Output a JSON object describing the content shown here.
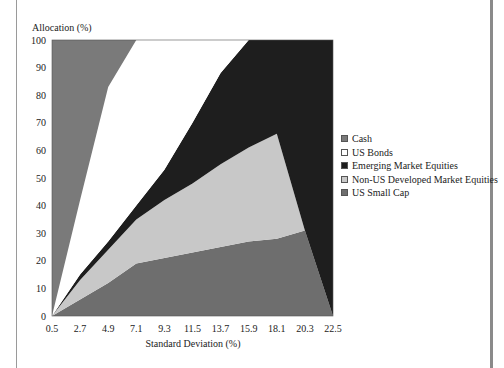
{
  "chart_data": {
    "type": "area",
    "stacked": true,
    "title": "",
    "xlabel": "Standard Deviation (%)",
    "ylabel": "Allocation (%)",
    "x": [
      0.5,
      2.7,
      4.9,
      7.1,
      9.3,
      11.5,
      13.7,
      15.9,
      18.1,
      20.3,
      22.5
    ],
    "xticks": [
      "0.5",
      "2.7",
      "4.9",
      "7.1",
      "9.3",
      "11.5",
      "13.7",
      "15.9",
      "18.1",
      "20.3",
      "22.5"
    ],
    "yticks": [
      "0",
      "10",
      "20",
      "30",
      "40",
      "50",
      "60",
      "70",
      "80",
      "90",
      "100"
    ],
    "ylim": [
      0,
      100
    ],
    "xlim": [
      0.5,
      22.5
    ],
    "grid": false,
    "legend_position": "right",
    "series": [
      {
        "name": "US Small Cap",
        "color": "#6e6e6e",
        "values": [
          0,
          6,
          12,
          19,
          21,
          23,
          25,
          27,
          28,
          31,
          0
        ]
      },
      {
        "name": "Non-US Developed Market Equities",
        "color": "#c8c8c8",
        "values": [
          0,
          7,
          12,
          16,
          21,
          25,
          30,
          34,
          38,
          0,
          0
        ]
      },
      {
        "name": "Emerging Market Equities",
        "color": "#1e1e1e",
        "values": [
          0,
          2,
          3,
          5,
          11,
          22,
          33,
          39,
          34,
          69,
          100
        ]
      },
      {
        "name": "US Bonds",
        "color": "#ffffff",
        "values": [
          0,
          27,
          56,
          60,
          47,
          30,
          12,
          0,
          0,
          0,
          0
        ]
      },
      {
        "name": "Cash",
        "color": "#7a7a7a",
        "values": [
          100,
          58,
          17,
          0,
          0,
          0,
          0,
          0,
          0,
          0,
          0
        ]
      }
    ],
    "legend": [
      "Cash",
      "US Bonds",
      "Emerging Market Equities",
      "Non-US Developed Market Equities",
      "US Small Cap"
    ]
  },
  "legend": {
    "items": [
      {
        "label": "Cash",
        "color": "#7a7a7a"
      },
      {
        "label": "US Bonds",
        "color": "#ffffff"
      },
      {
        "label": "Emerging Market Equities",
        "color": "#1e1e1e"
      },
      {
        "label": "Non-US Developed Market Equities",
        "color": "#c8c8c8"
      },
      {
        "label": "US Small Cap",
        "color": "#6e6e6e"
      }
    ]
  },
  "axes": {
    "ylabel": "Allocation (%)",
    "xlabel": "Standard Deviation (%)"
  }
}
